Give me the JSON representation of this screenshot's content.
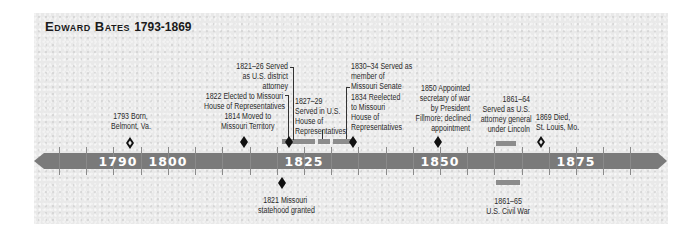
{
  "title": {
    "name": "Edward Bates",
    "years": "1793-1869"
  },
  "colors": {
    "axis": "#7a7a7a",
    "marker": "#111111",
    "bar": "#8c8c8c",
    "panel": "#e9e9e9",
    "label": "#ffffff"
  },
  "axis": {
    "labels": [
      "1790",
      "1800",
      "1825",
      "1850",
      "1875"
    ],
    "start_year": 1780,
    "end_year": 1890,
    "tick_interval": 5
  },
  "events": {
    "born": {
      "line1": "1793 Born,",
      "line2": "Belmont, Va."
    },
    "missouri_territory": {
      "line1": "1814 Moved to",
      "line2": "Missouri Territory"
    },
    "statehood": {
      "line1": "1821 Missouri",
      "line2": "statehood granted"
    },
    "district_attorney": {
      "line1": "1821–26 Served",
      "line2": "as U.S. district",
      "line3": "attorney"
    },
    "elected_house": {
      "line1": "1822 Elected to Missouri",
      "line2": "House of Representatives"
    },
    "us_house": {
      "line1": "1827–29",
      "line2": "Served in U.S.",
      "line3": "House of",
      "line4": "Representatives"
    },
    "senate": {
      "line1": "1830–34 Served as",
      "line2": "member of",
      "line3": "Missouri Senate"
    },
    "reelected": {
      "line1": "1834 Reelected",
      "line2": "to Missouri",
      "line3": "House of",
      "line4": "Representatives"
    },
    "secretary_war": {
      "line1": "1850 Appointed",
      "line2": "secretary of war",
      "line3": "by President",
      "line4": "Fillmore; declined",
      "line5": "appointment"
    },
    "attorney_general": {
      "line1": "1861–64",
      "line2": "Served as U.S.",
      "line3": "attorney general",
      "line4": "under Lincoln"
    },
    "died": {
      "line1": "1869 Died,",
      "line2": "St. Louis, Mo."
    },
    "civil_war": {
      "line1": "1861–65",
      "line2": "U.S. Civil War"
    }
  }
}
